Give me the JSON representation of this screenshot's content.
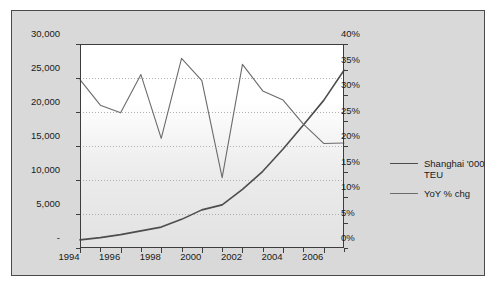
{
  "chart_data": {
    "type": "line",
    "title": "",
    "xlabel": "",
    "ylabel": "",
    "grid": true,
    "legend_position": "right",
    "x": [
      1994,
      1995,
      1996,
      1997,
      1998,
      1999,
      2000,
      2001,
      2002,
      2003,
      2004,
      2005,
      2006,
      2007
    ],
    "xtick_labels": [
      "1994",
      "1996",
      "1998",
      "2000",
      "2002",
      "2004",
      "2006"
    ],
    "xtick_values": [
      1994,
      1996,
      1998,
      2000,
      2002,
      2004,
      2006
    ],
    "axes": [
      {
        "id": "left",
        "ylim": [
          0,
          30000
        ],
        "ytick_values": [
          0,
          5000,
          10000,
          15000,
          20000,
          25000,
          30000
        ],
        "ytick_labels": [
          "-",
          "5,000",
          "10,000",
          "15,000",
          "20,000",
          "25,000",
          "30,000"
        ]
      },
      {
        "id": "right",
        "ylim": [
          0,
          40
        ],
        "ytick_values": [
          0,
          5,
          10,
          15,
          20,
          25,
          30,
          35,
          40
        ],
        "ytick_labels": [
          "0%",
          "5%",
          "10%",
          "15%",
          "20%",
          "25%",
          "30%",
          "35%",
          "40%"
        ]
      }
    ],
    "series": [
      {
        "name": "Shanghai '000 TEU",
        "axis": "left",
        "color": "#4d4d4d",
        "width": 1.6,
        "values": [
          1200,
          1530,
          1970,
          2520,
          3070,
          4210,
          5610,
          6340,
          8620,
          11280,
          14550,
          18080,
          21710,
          26150
        ]
      },
      {
        "name": "YoY % chg",
        "axis": "right",
        "color": "#6b6b6b",
        "width": 1.1,
        "values": [
          33.0,
          28.0,
          26.5,
          34.0,
          21.5,
          37.2,
          32.8,
          13.8,
          36.0,
          30.8,
          29.0,
          24.3,
          20.5,
          20.6
        ]
      }
    ]
  },
  "legend": {
    "items": [
      {
        "label": "Shanghai '000 TEU",
        "marker": "line-swatch"
      },
      {
        "label": "YoY % chg",
        "marker": "line-swatch"
      }
    ]
  }
}
